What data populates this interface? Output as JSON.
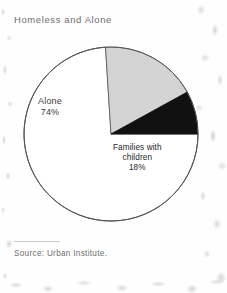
{
  "chart_data": {
    "type": "pie",
    "title": "Homeless and Alone",
    "source": "Source: Urban Institute.",
    "categories": [
      "Alone",
      "Families with children",
      "Childless groups"
    ],
    "values": [
      74,
      18,
      8
    ],
    "unit": "%",
    "start_angle_deg": 90,
    "direction": "clockwise",
    "legend": "none",
    "slices": [
      {
        "name": "Alone",
        "label_line1": "Alone",
        "label_pct": "74%",
        "value": 74,
        "color": "#ffffff",
        "text_color": "#3a3a3a"
      },
      {
        "name": "Families with children",
        "label_line1": "Families with",
        "label_line2": "children",
        "label_pct": "18%",
        "value": 18,
        "color": "#d4d4d4",
        "text_color": "#1e1e1e"
      },
      {
        "name": "Childless groups",
        "label_line1": "Childless",
        "label_line2": "groups",
        "label_pct": "8%",
        "value": 8,
        "color": "#111111",
        "text_color": "#ffffff"
      }
    ],
    "outline_color": "#555555",
    "background": "#fefefe"
  }
}
